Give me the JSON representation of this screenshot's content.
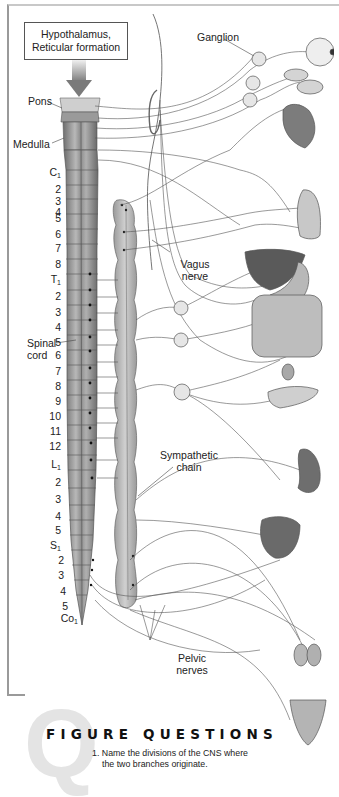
{
  "figure": {
    "top_box": {
      "line1": "Hypothalamus,",
      "line2": "Reticular formation"
    },
    "labels": {
      "pons": "Pons",
      "medulla": "Medulla",
      "ganglion": "Ganglion",
      "vagus_nerve_line1": "Vagus",
      "vagus_nerve_line2": "nerve",
      "spinal_cord_line1": "Spinal",
      "spinal_cord_line2": "cord",
      "sympathetic_chain_line1": "Sympathetic",
      "sympathetic_chain_line2": "chain",
      "pelvic_nerves_line1": "Pelvic",
      "pelvic_nerves_line2": "nerves"
    },
    "segments": {
      "cervical": [
        "C1",
        "2",
        "3",
        "4",
        "5",
        "6",
        "7",
        "8"
      ],
      "thoracic": [
        "T1",
        "2",
        "3",
        "4",
        "5",
        "6",
        "7",
        "8",
        "9",
        "10",
        "11",
        "12"
      ],
      "lumbar": [
        "L1",
        "2",
        "3",
        "4",
        "5"
      ],
      "sacral": [
        "S1",
        "2",
        "3",
        "4",
        "5"
      ],
      "coccygeal": [
        "Co1"
      ]
    },
    "organs": [
      "eye",
      "salivary-glands",
      "heart",
      "lungs",
      "liver",
      "stomach",
      "intestines",
      "adrenal-gland",
      "pancreas",
      "kidney",
      "bladder",
      "genitals",
      "uterus"
    ],
    "colors": {
      "line": "#555555",
      "cord": "#8a8a8a",
      "frame": "#9a9a9a",
      "q_glyph": "#e4e4e4"
    }
  },
  "figure_questions": {
    "title": "FIGURE QUESTIONS",
    "q_letter": "Q",
    "items": [
      {
        "line1": "1. Name the divisions of the CNS where",
        "line2": "the two branches originate."
      }
    ]
  }
}
